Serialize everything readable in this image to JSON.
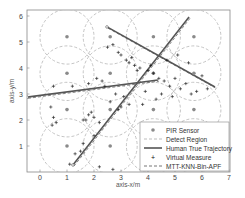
{
  "chart_data": {
    "type": "scatter",
    "title": "",
    "xlabel": "axis-x/m",
    "ylabel": "axis-y/m",
    "xlim": [
      -0.5,
      7.0
    ],
    "ylim": [
      0,
      6.2
    ],
    "xticks": [
      0,
      1,
      2,
      3,
      4,
      5,
      6,
      7
    ],
    "yticks": [
      1,
      2,
      3,
      4,
      5,
      6
    ],
    "grid": false,
    "legend_position": "lower right",
    "legend": [
      "PIR Sensor",
      "Detect Region",
      "Human True Trajectory",
      "Virtual Measure",
      "MTT-KNN-Bin-APF"
    ],
    "sensors": {
      "x": [
        1.0,
        2.6,
        4.2,
        5.7
      ],
      "y": [
        1.0,
        2.4,
        3.8,
        5.2
      ],
      "detect_radius": 1.0
    },
    "trajectories": [
      {
        "name": "Human True Trajectory 1",
        "x": [
          2.48,
          6.48
        ],
        "y": [
          5.58,
          3.27
        ]
      },
      {
        "name": "Human True Trajectory 2",
        "x": [
          1.22,
          5.52
        ],
        "y": [
          0.27,
          5.96
        ]
      },
      {
        "name": "Human True Trajectory 3",
        "x": [
          -0.48,
          4.37
        ],
        "y": [
          2.88,
          3.54
        ]
      }
    ],
    "virtual_measures": {
      "x": [
        0.4,
        0.5,
        0.6,
        0.45,
        1.7,
        1.8,
        1.9,
        2.0,
        1.8,
        2.1,
        2.3,
        2.4,
        2.5,
        2.7,
        2.9,
        3.0,
        3.2,
        3.4,
        3.3,
        3.5,
        3.7,
        3.6,
        4.0,
        4.2,
        4.4,
        4.6,
        4.8,
        5.0,
        5.2,
        5.4,
        5.6,
        5.8,
        6.0,
        6.2,
        4.3,
        4.5,
        3.1,
        2.8,
        2.6,
        2.2,
        2.0,
        1.6,
        1.5,
        1.3,
        1.1,
        2.2,
        2.7,
        3.0,
        0.5,
        1.2,
        1.6,
        4.1,
        4.7,
        5.1,
        3.8,
        3.9,
        5.5,
        4.9,
        2.9,
        3.3
      ],
      "y": [
        2.5,
        2.1,
        1.9,
        1.8,
        2.0,
        2.2,
        2.3,
        2.1,
        3.4,
        3.6,
        3.5,
        3.3,
        4.8,
        4.9,
        4.6,
        4.5,
        4.3,
        4.4,
        4.2,
        4.1,
        4.0,
        3.9,
        3.9,
        3.8,
        3.6,
        3.5,
        3.3,
        3.6,
        3.2,
        3.4,
        3.0,
        3.1,
        3.7,
        3.2,
        2.8,
        3.0,
        2.9,
        3.0,
        2.7,
        1.9,
        1.4,
        1.1,
        0.8,
        0.7,
        0.3,
        0.2,
        0.1,
        2.5,
        3.3,
        3.3,
        2.0,
        4.1,
        4.3,
        4.5,
        2.6,
        3.1,
        4.2,
        2.9,
        2.4,
        2.6
      ]
    }
  },
  "legend_items": {
    "sensor": "PIR Sensor",
    "region": "Detect Region",
    "truth": "Human True Trajectory",
    "virtual": "Virtual Measure",
    "apf": "MTT-KNN-Bin-APF"
  },
  "axes": {
    "xlabel": "axis-x/m",
    "ylabel": "axis-y/m",
    "xticks": [
      "0",
      "1",
      "2",
      "3",
      "4",
      "5",
      "6",
      "7"
    ],
    "yticks": [
      "1",
      "2",
      "3",
      "4",
      "5",
      "6"
    ]
  },
  "colors": {
    "sensor": "#8a8a8a",
    "region": "#bdbdbd",
    "truth": "#555555",
    "virtual": "#111111",
    "apf": "#777777",
    "frame": "#888888"
  }
}
